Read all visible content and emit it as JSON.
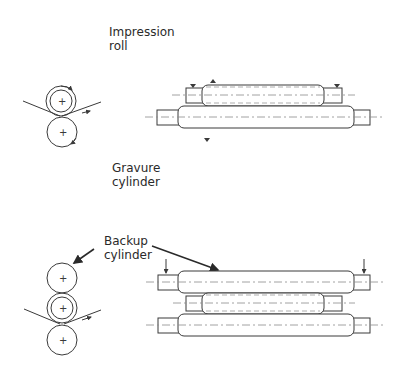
{
  "labels": {
    "impression_roll": "Impression\nroll",
    "gravure_cylinder": "Gravure\ncylinder",
    "backup_cylinder": "Backup\ncylinder"
  },
  "colors": {
    "line": "#3a3a3a",
    "centerline": "#8a8a8a",
    "text": "#2a2a2a"
  }
}
